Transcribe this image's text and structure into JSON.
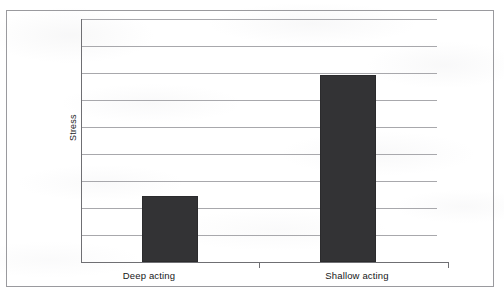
{
  "chart_data": {
    "type": "bar",
    "title": "",
    "subtitle": "",
    "xlabel": "",
    "ylabel": "Stress",
    "categories": [
      "Deep acting",
      "Shallow acting"
    ],
    "values": [
      2.7,
      7.7
    ],
    "ylim": [
      0,
      10
    ],
    "y_tick_labels": [],
    "gridlines": {
      "visible": true,
      "orientation": "horizontal",
      "count": 9,
      "values": [
        10,
        8.89,
        7.78,
        6.67,
        5.56,
        4.44,
        3.33,
        2.22,
        1.11
      ]
    },
    "legend": {
      "visible": false,
      "position": "none"
    },
    "series": [
      {
        "name": "Stress",
        "color": "#333335",
        "values": [
          2.7,
          7.7
        ]
      }
    ],
    "annotations": [],
    "axis": {
      "y_axis_line": true,
      "x_axis_line": true,
      "x_tick_between_categories": true
    }
  },
  "figure": {
    "border_color": "#9a9a9e",
    "background_color": "#ffffff",
    "grid_color": "#a8a8ac",
    "axis_color": "#6f6f73",
    "bar_color": "#333335",
    "text_color": "#161618"
  }
}
